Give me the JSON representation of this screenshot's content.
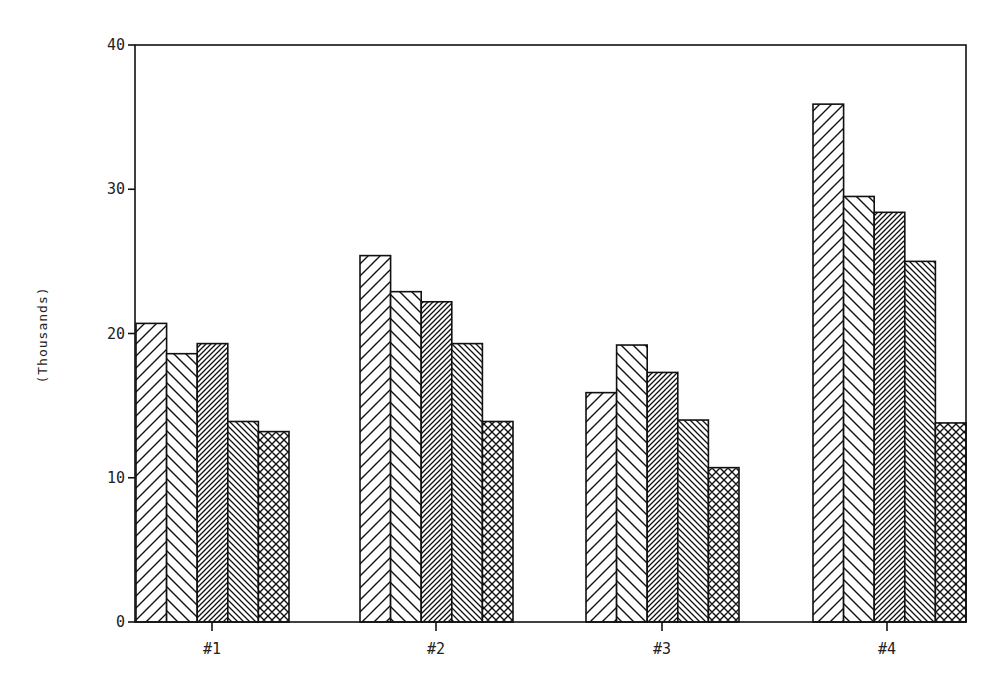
{
  "chart_data": {
    "type": "bar",
    "title": "",
    "xlabel": "",
    "ylabel": "(Thousands)",
    "ylim": [
      0,
      40
    ],
    "yticks": [
      0,
      10,
      20,
      30,
      40
    ],
    "grid": false,
    "legend": null,
    "categories": [
      "#1",
      "#2",
      "#3",
      "#4"
    ],
    "series": [
      {
        "name": "Series 1",
        "pattern": "wide-forward-diagonal",
        "values": [
          20.7,
          25.4,
          15.9,
          35.9
        ]
      },
      {
        "name": "Series 2",
        "pattern": "wide-backward-diagonal",
        "values": [
          18.6,
          22.9,
          19.2,
          29.5
        ]
      },
      {
        "name": "Series 3",
        "pattern": "dense-forward-diagonal",
        "values": [
          19.3,
          22.2,
          17.3,
          28.4
        ]
      },
      {
        "name": "Series 4",
        "pattern": "dense-backward-diagonal",
        "values": [
          13.9,
          19.3,
          14.0,
          25.0
        ]
      },
      {
        "name": "Series 5",
        "pattern": "crosshatch",
        "values": [
          13.2,
          13.9,
          10.7,
          13.8
        ]
      }
    ]
  },
  "colors": {
    "ink": "#111111",
    "background": "#ffffff"
  }
}
